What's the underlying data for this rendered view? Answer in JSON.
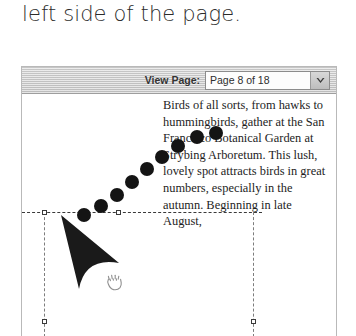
{
  "caption": "left side of the page.",
  "panel": {
    "toolbar": {
      "label": "View Page:",
      "page_select": {
        "value": "Page 8 of 18",
        "arrow_icon": "chevron-down-icon"
      }
    },
    "document": {
      "body_text": "Birds of all sorts, from hawks to hummingbirds, gather at the San Francisco Botanical Garden at Strybing Arboretum. This lush, lovely spot attracts birds in great numbers, especially in the autumn. Beginning in late August,"
    },
    "overlay": {
      "cursor_icon": "grab-hand-cursor-icon",
      "shape_name": "curved-triangle-shape",
      "dot_color": "#141414",
      "guide_color": "#7d7d7d",
      "dots": [
        {
          "x": 62,
          "y": 148,
          "r": 7
        },
        {
          "x": 79,
          "y": 139,
          "r": 7
        },
        {
          "x": 95,
          "y": 128,
          "r": 7
        },
        {
          "x": 110,
          "y": 115,
          "r": 7
        },
        {
          "x": 125,
          "y": 102,
          "r": 7
        },
        {
          "x": 140,
          "y": 90,
          "r": 7
        },
        {
          "x": 156,
          "y": 79,
          "r": 7
        },
        {
          "x": 175,
          "y": 70,
          "r": 7
        },
        {
          "x": 194,
          "y": 66,
          "r": 7
        }
      ],
      "selection": {
        "handles": [
          {
            "x": 20,
            "y": 143
          },
          {
            "x": 94,
            "y": 143
          },
          {
            "x": 20,
            "y": 252
          },
          {
            "x": 229,
            "y": 252
          }
        ]
      }
    }
  }
}
